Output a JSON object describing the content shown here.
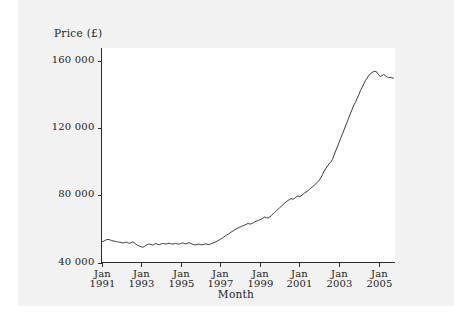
{
  "figure": {
    "background_color": "#f2f2f2",
    "page_color": "#ffffff",
    "line_color": "#3a3a3a",
    "axis_color": "#2b2b2b"
  },
  "chart_data": {
    "type": "line",
    "title": "",
    "xlabel": "Month",
    "ylabel": "Price (£)",
    "ylim": [
      40000,
      168000
    ],
    "xlim": [
      "Jan 1991",
      "Oct 2005"
    ],
    "grid": false,
    "legend": null,
    "y_ticks": [
      40000,
      80000,
      120000,
      160000
    ],
    "y_tick_labels": [
      "40 000",
      "80 000",
      "120 000",
      "160 000"
    ],
    "x_ticks": [
      "Jan 1991",
      "Jan 1993",
      "Jan 1995",
      "Jan 1997",
      "Jan 1999",
      "Jan 2001",
      "Jan 2003",
      "Jan 2005"
    ],
    "x_tick_labels": [
      {
        "month": "Jan",
        "year": "1991"
      },
      {
        "month": "Jan",
        "year": "1993"
      },
      {
        "month": "Jan",
        "year": "1995"
      },
      {
        "month": "Jan",
        "year": "1997"
      },
      {
        "month": "Jan",
        "year": "1999"
      },
      {
        "month": "Jan",
        "year": "2001"
      },
      {
        "month": "Jan",
        "year": "2003"
      },
      {
        "month": "Jan",
        "year": "2005"
      }
    ],
    "x_start_year": 1991.0,
    "x_end_year": 2005.83,
    "series": [
      {
        "name": "Price",
        "x": [
          1991.0,
          1991.08,
          1991.17,
          1991.25,
          1991.33,
          1991.42,
          1991.5,
          1991.58,
          1991.67,
          1991.75,
          1991.83,
          1991.92,
          1992.0,
          1992.08,
          1992.17,
          1992.25,
          1992.33,
          1992.42,
          1992.5,
          1992.58,
          1992.67,
          1992.75,
          1992.83,
          1992.92,
          1993.0,
          1993.08,
          1993.17,
          1993.25,
          1993.33,
          1993.42,
          1993.5,
          1993.58,
          1993.67,
          1993.75,
          1993.83,
          1993.92,
          1994.0,
          1994.08,
          1994.17,
          1994.25,
          1994.33,
          1994.42,
          1994.5,
          1994.58,
          1994.67,
          1994.75,
          1994.83,
          1994.92,
          1995.0,
          1995.08,
          1995.17,
          1995.25,
          1995.33,
          1995.42,
          1995.5,
          1995.58,
          1995.67,
          1995.75,
          1995.83,
          1995.92,
          1996.0,
          1996.08,
          1996.17,
          1996.25,
          1996.33,
          1996.42,
          1996.5,
          1996.58,
          1996.67,
          1996.75,
          1996.83,
          1996.92,
          1997.0,
          1997.08,
          1997.17,
          1997.25,
          1997.33,
          1997.42,
          1997.5,
          1997.58,
          1997.67,
          1997.75,
          1997.83,
          1997.92,
          1998.0,
          1998.08,
          1998.17,
          1998.25,
          1998.33,
          1998.42,
          1998.5,
          1998.58,
          1998.67,
          1998.75,
          1998.83,
          1998.92,
          1999.0,
          1999.08,
          1999.17,
          1999.25,
          1999.33,
          1999.42,
          1999.5,
          1999.58,
          1999.67,
          1999.75,
          1999.83,
          1999.92,
          2000.0,
          2000.08,
          2000.17,
          2000.25,
          2000.33,
          2000.42,
          2000.5,
          2000.58,
          2000.67,
          2000.75,
          2000.83,
          2000.92,
          2001.0,
          2001.08,
          2001.17,
          2001.25,
          2001.33,
          2001.42,
          2001.5,
          2001.58,
          2001.67,
          2001.75,
          2001.83,
          2001.92,
          2002.0,
          2002.08,
          2002.17,
          2002.25,
          2002.33,
          2002.42,
          2002.5,
          2002.58,
          2002.67,
          2002.75,
          2002.83,
          2002.92,
          2003.0,
          2003.08,
          2003.17,
          2003.25,
          2003.33,
          2003.42,
          2003.5,
          2003.58,
          2003.67,
          2003.75,
          2003.83,
          2003.92,
          2004.0,
          2004.08,
          2004.17,
          2004.25,
          2004.33,
          2004.42,
          2004.5,
          2004.58,
          2004.67,
          2004.75,
          2004.83,
          2004.92,
          2005.0,
          2005.08,
          2005.17,
          2005.25,
          2005.33,
          2005.42,
          2005.5,
          2005.58,
          2005.67,
          2005.75
        ],
        "values": [
          52400,
          52600,
          53100,
          53600,
          53800,
          53500,
          53200,
          52900,
          52700,
          52500,
          52300,
          52100,
          51900,
          51600,
          51900,
          52200,
          51800,
          51400,
          51900,
          52300,
          51600,
          50800,
          50200,
          49800,
          49400,
          49100,
          49600,
          50300,
          50800,
          51000,
          50700,
          50400,
          50900,
          51300,
          50900,
          50600,
          51000,
          51400,
          51200,
          51000,
          51300,
          51500,
          51200,
          51000,
          51200,
          51400,
          51100,
          50900,
          51300,
          51700,
          51400,
          51100,
          51400,
          51800,
          51400,
          51000,
          50700,
          50500,
          50800,
          51000,
          50700,
          50500,
          50800,
          51100,
          50900,
          50700,
          51000,
          51400,
          51800,
          52200,
          52700,
          53200,
          53800,
          54400,
          55100,
          55800,
          56400,
          57000,
          57700,
          58400,
          59000,
          59600,
          60200,
          60700,
          61200,
          61600,
          62000,
          62400,
          62900,
          63300,
          62900,
          63200,
          63700,
          64200,
          64700,
          65100,
          65500,
          66000,
          66600,
          67200,
          66800,
          66500,
          67100,
          68000,
          69000,
          69900,
          70800,
          71700,
          72600,
          73500,
          74500,
          75400,
          76200,
          77000,
          77600,
          78100,
          77800,
          78200,
          79000,
          79800,
          79300,
          79700,
          80600,
          81400,
          82000,
          82700,
          83600,
          84400,
          85300,
          86100,
          87000,
          88000,
          89000,
          90500,
          92500,
          94500,
          96000,
          97500,
          99000,
          99700,
          101500,
          104000,
          106500,
          109000,
          111500,
          114000,
          116500,
          119000,
          121500,
          124000,
          126500,
          129000,
          131500,
          134000,
          135500,
          138000,
          140000,
          142500,
          144500,
          146500,
          148500,
          150000,
          151500,
          152500,
          153400,
          153900,
          154100,
          153500,
          152000,
          151000,
          151500,
          152200,
          151600,
          150800,
          150300,
          150600,
          150200,
          150000
        ]
      }
    ]
  }
}
